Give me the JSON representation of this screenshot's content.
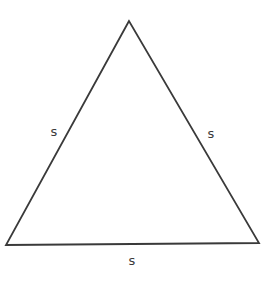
{
  "diagram": {
    "shape": "triangle",
    "stroke_color": "#3a3a3a",
    "background": "#ffffff",
    "vertices": {
      "apex": [
        129,
        21
      ],
      "bottom_left": [
        6,
        245
      ],
      "bottom_right": [
        259,
        243
      ]
    },
    "labels": {
      "left_side": "s",
      "right_side": "s",
      "bottom_side": "s"
    }
  }
}
